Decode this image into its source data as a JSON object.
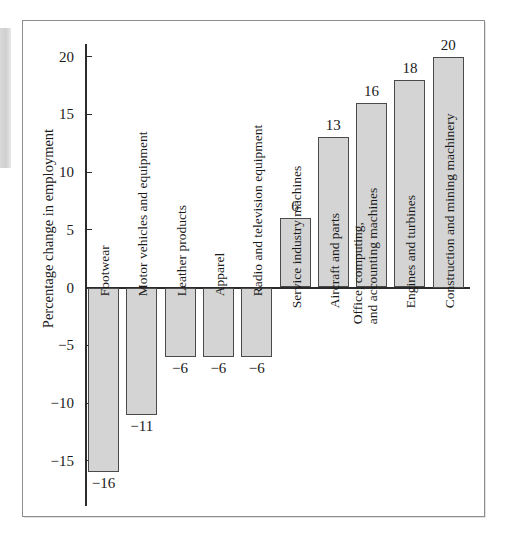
{
  "chart_data": {
    "type": "bar",
    "title": "",
    "xlabel": "",
    "ylabel": "Percentage change in employment",
    "ylim": [
      -18,
      21
    ],
    "grid": false,
    "legend": "none",
    "y_ticks": [
      20,
      15,
      10,
      5,
      0,
      -5,
      -10,
      -15
    ],
    "y_tick_labels": [
      "20",
      "15",
      "10",
      "5",
      "0",
      "−5",
      "−10",
      "−15"
    ],
    "categories": [
      "Footwear",
      "Motor vehicles and equipment",
      "Leather products",
      "Apparel",
      "Radio and television equipment",
      "Service industry machines",
      "Aircraft and parts",
      "Office, computing,\nand accounting machines",
      "Engines and turbines",
      "Construction and mining machinery"
    ],
    "values": [
      -16,
      -11,
      -6,
      -6,
      -6,
      6,
      13,
      16,
      18,
      20
    ],
    "value_labels": [
      "−16",
      "−11",
      "−6",
      "−6",
      "−6",
      "6",
      "13",
      "16",
      "18",
      "20"
    ]
  },
  "axis": {
    "y_title": "Percentage change in employment",
    "ticks": [
      {
        "label": "20",
        "value": 20
      },
      {
        "label": "15",
        "value": 15
      },
      {
        "label": "10",
        "value": 10
      },
      {
        "label": "5",
        "value": 5
      },
      {
        "label": "0",
        "value": 0
      },
      {
        "label": "−5",
        "value": -5
      },
      {
        "label": "−10",
        "value": -10
      },
      {
        "label": "−15",
        "value": -15
      }
    ]
  },
  "bars": [
    {
      "category": "Footwear",
      "value": -16,
      "label": "−16",
      "line1": "Footwear",
      "line2": ""
    },
    {
      "category": "Motor vehicles and equipment",
      "value": -11,
      "label": "−11",
      "line1": "Motor vehicles and equipment",
      "line2": ""
    },
    {
      "category": "Leather products",
      "value": -6,
      "label": "−6",
      "line1": "Leather products",
      "line2": ""
    },
    {
      "category": "Apparel",
      "value": -6,
      "label": "−6",
      "line1": "Apparel",
      "line2": ""
    },
    {
      "category": "Radio and television equipment",
      "value": -6,
      "label": "−6",
      "line1": "Radio and television equipment",
      "line2": ""
    },
    {
      "category": "Service industry machines",
      "value": 6,
      "label": "6",
      "line1": "Service industry machines",
      "line2": ""
    },
    {
      "category": "Aircraft and parts",
      "value": 13,
      "label": "13",
      "line1": "Aircraft and parts",
      "line2": ""
    },
    {
      "category": "Office, computing, and accounting machines",
      "value": 16,
      "label": "16",
      "line1": "Office, computing,",
      "line2": "and accounting machines"
    },
    {
      "category": "Engines and turbines",
      "value": 18,
      "label": "18",
      "line1": "Engines and turbines",
      "line2": ""
    },
    {
      "category": "Construction and mining machinery",
      "value": 20,
      "label": "20",
      "line1": "Construction and mining machinery",
      "line2": ""
    }
  ],
  "colors": {
    "bar_fill": "#d4d4d4",
    "bar_stroke": "#4a4a4a",
    "axis": "#2b2b2b",
    "text": "#1a1a1a",
    "frame": "#8d8d8d"
  }
}
